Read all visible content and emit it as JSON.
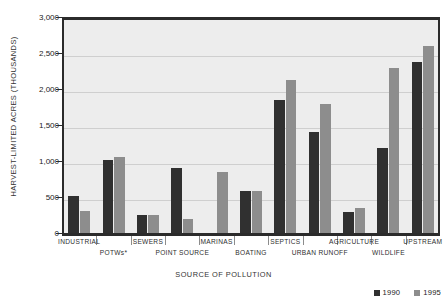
{
  "chart_data": {
    "type": "bar",
    "title": "",
    "xlabel": "SOURCE OF POLLUTION",
    "ylabel": "HARVEST-LIMITED ACRES (THOUSANDS)",
    "ylim": [
      0,
      3000
    ],
    "ytick_labels": [
      "3,000",
      "2,500",
      "2,000",
      "1,500",
      "1,000",
      "500",
      "0"
    ],
    "ytick_values": [
      3000,
      2500,
      2000,
      1500,
      1000,
      500,
      0
    ],
    "grid": true,
    "legend_position": "bottom-right",
    "categories": [
      "INDUSTRIAL",
      "POTWs*",
      "SEWERS",
      "POINT SOURCE",
      "MARINAS",
      "BOATING",
      "SEPTICS",
      "URBAN RUNOFF",
      "AGRICULTURE",
      "WILDLIFE",
      "UPSTREAM"
    ],
    "series": [
      {
        "name": "1990",
        "color": "#303030",
        "values": [
          520,
          1010,
          255,
          900,
          0,
          590,
          1850,
          1400,
          290,
          1180,
          2380
        ]
      },
      {
        "name": "1995",
        "color": "#8d8d8d",
        "values": [
          300,
          1050,
          250,
          195,
          850,
          590,
          2130,
          1790,
          350,
          2290,
          2600
        ]
      }
    ]
  },
  "legend": {
    "items": [
      {
        "label": "1990",
        "color": "#303030"
      },
      {
        "label": "1995",
        "color": "#8d8d8d"
      }
    ]
  }
}
